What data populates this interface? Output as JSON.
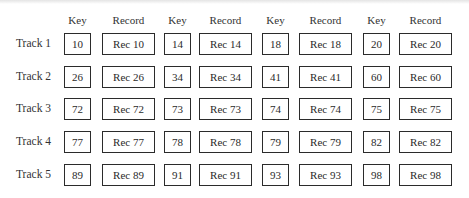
{
  "headers": [
    "Key",
    "Record",
    "Key",
    "Record",
    "Key",
    "Record",
    "Key",
    "Record"
  ],
  "tracks": [
    {
      "label": "Track 1",
      "entries": [
        {
          "key": "10",
          "record": "Rec 10"
        },
        {
          "key": "14",
          "record": "Rec 14"
        },
        {
          "key": "18",
          "record": "Rec 18"
        },
        {
          "key": "20",
          "record": "Rec 20"
        }
      ]
    },
    {
      "label": "Track 2",
      "entries": [
        {
          "key": "26",
          "record": "Rec 26"
        },
        {
          "key": "34",
          "record": "Rec 34"
        },
        {
          "key": "41",
          "record": "Rec 41"
        },
        {
          "key": "60",
          "record": "Rec 60"
        }
      ]
    },
    {
      "label": "Track 3",
      "entries": [
        {
          "key": "72",
          "record": "Rec 72"
        },
        {
          "key": "73",
          "record": "Rec 73"
        },
        {
          "key": "74",
          "record": "Rec 74"
        },
        {
          "key": "75",
          "record": "Rec 75"
        }
      ]
    },
    {
      "label": "Track 4",
      "entries": [
        {
          "key": "77",
          "record": "Rec 77"
        },
        {
          "key": "78",
          "record": "Rec 78"
        },
        {
          "key": "79",
          "record": "Rec 79"
        },
        {
          "key": "82",
          "record": "Rec 82"
        }
      ]
    },
    {
      "label": "Track 5",
      "entries": [
        {
          "key": "89",
          "record": "Rec 89"
        },
        {
          "key": "91",
          "record": "Rec 91"
        },
        {
          "key": "93",
          "record": "Rec 93"
        },
        {
          "key": "98",
          "record": "Rec 98"
        }
      ]
    }
  ]
}
